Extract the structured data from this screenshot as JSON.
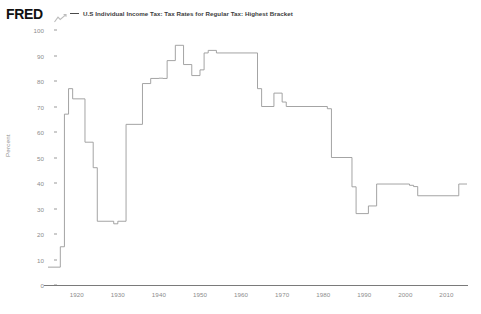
{
  "header": {
    "logo": "FRED",
    "logo_icon": "fred-squiggle-icon",
    "legend_label": "U.S Individual Income Tax: Tax Rates for Regular Tax: Highest Bracket",
    "legend_color": "#4a4a4a"
  },
  "axes": {
    "y_title": "Percent",
    "y_ticks": [
      "100",
      "90",
      "80",
      "70",
      "60",
      "50",
      "40",
      "30",
      "20",
      "10",
      "0"
    ],
    "x_ticks": [
      "1920",
      "1930",
      "1940",
      "1950",
      "1960",
      "1970",
      "1980",
      "1990",
      "2000",
      "2010"
    ]
  },
  "chart_data": {
    "type": "line",
    "title": "U.S Individual Income Tax: Tax Rates for Regular Tax: Highest Bracket",
    "xlabel": "",
    "ylabel": "Percent",
    "xlim": [
      1913,
      2015
    ],
    "ylim": [
      0,
      100
    ],
    "grid": false,
    "legend_position": "top",
    "step": "post",
    "line_color": "#9a9a9a",
    "series": [
      {
        "name": "U.S Individual Income Tax: Tax Rates for Regular Tax: Highest Bracket",
        "x": [
          1913,
          1916,
          1917,
          1918,
          1919,
          1922,
          1924,
          1925,
          1929,
          1930,
          1932,
          1936,
          1938,
          1940,
          1941,
          1942,
          1944,
          1946,
          1948,
          1950,
          1951,
          1952,
          1954,
          1964,
          1965,
          1968,
          1970,
          1971,
          1981,
          1982,
          1987,
          1988,
          1991,
          1993,
          2001,
          2002,
          2003,
          2013
        ],
        "y": [
          7,
          15,
          67,
          77,
          73,
          56,
          46,
          25,
          24,
          25,
          63,
          79,
          81,
          81.1,
          81,
          88,
          94,
          86.45,
          82.13,
          84.36,
          91,
          92,
          91,
          77,
          70,
          75.25,
          71.75,
          70,
          69.125,
          50,
          38.5,
          28,
          31,
          39.6,
          39.1,
          38.6,
          35,
          39.6
        ]
      }
    ]
  }
}
